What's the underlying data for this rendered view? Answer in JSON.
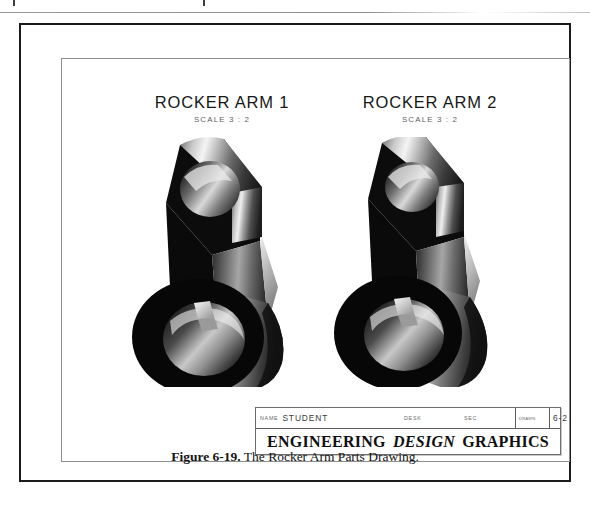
{
  "page": {
    "width": 590,
    "height": 506,
    "background": "#ffffff"
  },
  "drawing_sheet": {
    "parts": [
      {
        "name": "ROCKER ARM 1",
        "scale": "SCALE 3 : 2",
        "view_type": "shaded-isometric-solid"
      },
      {
        "name": "ROCKER ARM 2",
        "scale": "SCALE 3 : 2",
        "view_type": "shaded-isometric-solid"
      }
    ],
    "title_block": {
      "name_label": "NAME",
      "name_value": "STUDENT",
      "desk_label": "DESK",
      "desk_value": "",
      "sec_label": "SEC",
      "sec_value": "",
      "drawn_label": "DRAWN",
      "drawn_value": "",
      "number_label": "",
      "number_value": "6-2",
      "company_word_1": "ENGINEERING",
      "company_word_2": "DESIGN",
      "company_word_3": "GRAPHICS"
    }
  },
  "caption": {
    "label": "Figure 6-19.",
    "text": " The Rocker Arm Parts Drawing."
  },
  "colors": {
    "outer_frame": "#1b1b1b",
    "sheet_frame": "#8e8e8e",
    "ink": "#171717",
    "metal_highlight": "#f2f2f2",
    "metal_midtone": "#8a8a8a",
    "metal_shadow": "#0b0b0b"
  }
}
